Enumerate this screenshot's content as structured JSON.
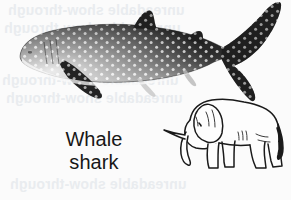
{
  "figure": {
    "background_color": "#fbfbfb",
    "caption": {
      "line1": "Whale",
      "line2": "shark",
      "full_text": "Whale shark",
      "color": "#171717"
    },
    "subjects": [
      {
        "name": "whale-shark",
        "style": "halftone grayscale photograph",
        "description": "Whale shark in left-facing profile with dark spotted body, pale underside, long crescent tail",
        "body_color": "#2b2b2b",
        "spot_color": "#e8e8e8",
        "belly_color": "#f2f2f2"
      },
      {
        "name": "elephant",
        "style": "black ink line drawing",
        "description": "African elephant in left-facing profile with trunk lowered, single tusk, large ear and hanging tail",
        "outline_color": "#1a1a1a",
        "fill_color": "#fdfdfd"
      }
    ],
    "ghost_text": {
      "note": "faint mirrored show-through text from the reverse side of the printed page",
      "color": "#e9ecef",
      "lines": [
        "unreadable show-through",
        "unreadable show-through",
        "unreadable show-through",
        "unreadable show-through",
        "unreadable show-through"
      ]
    }
  }
}
